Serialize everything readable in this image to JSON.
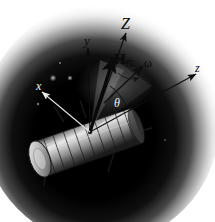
{
  "figure": {
    "background_color": "#ffffff",
    "vignette_color": "#000000",
    "width": 215,
    "height": 222
  },
  "labels": {
    "axis_Z": "Z",
    "axis_y": "y",
    "axis_z": "z",
    "axis_x": "x",
    "angular_momentum": "H",
    "angular_momentum_sub": "G",
    "angular_velocity": "ω",
    "nutation_angle": "θ"
  },
  "vectors": [
    {
      "name": "Z",
      "label": "Z",
      "style": "thin-arrow",
      "origin": [
        90,
        132
      ],
      "tip": [
        126,
        33
      ]
    },
    {
      "name": "y",
      "label": "y",
      "style": "thin-arrow",
      "origin": [
        90,
        132
      ],
      "tip": [
        88,
        48
      ]
    },
    {
      "name": "H_G",
      "label": "H",
      "subscript": "G",
      "style": "bold-arrow",
      "origin": [
        90,
        132
      ],
      "tip": [
        113,
        57
      ]
    },
    {
      "name": "omega",
      "label": "ω",
      "style": "thin-arrow",
      "origin": [
        90,
        132
      ],
      "tip": [
        143,
        66
      ]
    },
    {
      "name": "z",
      "label": "z",
      "style": "thin-arrow",
      "origin": [
        90,
        132
      ],
      "tip": [
        196,
        74
      ]
    },
    {
      "name": "x",
      "label": "x",
      "style": "thin-arrow",
      "origin": [
        90,
        132
      ],
      "tip": [
        42,
        92
      ]
    }
  ],
  "annotations": {
    "nutation_arc": "arc between body z-axis and H_G showing nutation angle θ",
    "precession_arc": "small arc near ω indicating precession"
  },
  "spacecraft": {
    "name": "cylindrical spin-stabilized satellite",
    "body_segments": 9,
    "booms": 5
  },
  "stars": [
    {
      "x": 53,
      "y": 78,
      "r": 2.2
    },
    {
      "x": 70,
      "y": 78,
      "r": 1.8
    },
    {
      "x": 38,
      "y": 104,
      "r": 1.2
    }
  ]
}
